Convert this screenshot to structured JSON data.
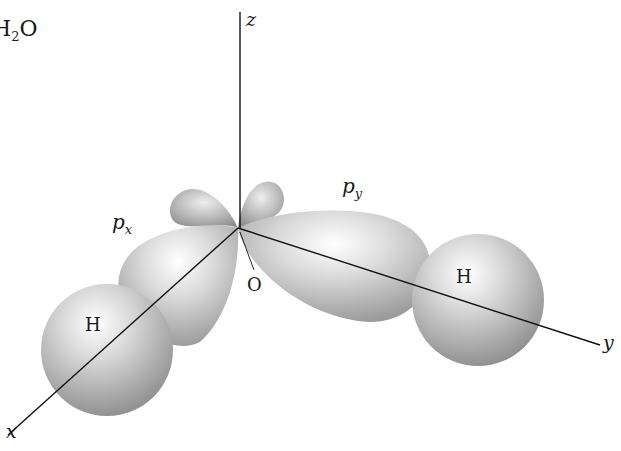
{
  "figure": {
    "title": {
      "prefix": "H",
      "subscript": "2",
      "suffix": "O"
    },
    "axes": {
      "z": "z",
      "x": "x",
      "y": "y"
    },
    "orbitals": {
      "px": {
        "base": "p",
        "subscript": "x"
      },
      "py": {
        "base": "p",
        "subscript": "y"
      }
    },
    "atoms": {
      "oxygen": "O",
      "hydrogen_1": "H",
      "hydrogen_2": "H"
    },
    "colors": {
      "background": "#ffffff",
      "axis_line": "#111111",
      "surface_highlight": "#ffffff",
      "surface_mid": "#c4c4c4",
      "surface_shadow": "#8a8a8a",
      "label_text": "#1a1a1a"
    }
  }
}
